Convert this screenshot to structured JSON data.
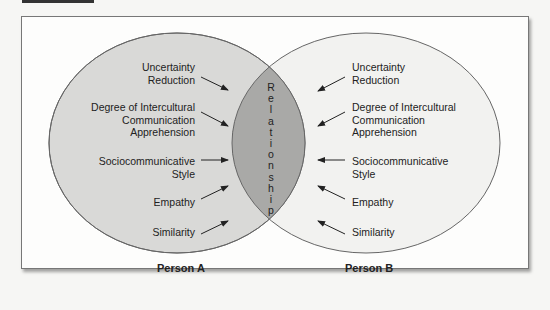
{
  "diagram": {
    "type": "venn",
    "colors": {
      "left_circle": "#d9d9d7",
      "right_circle": "#f2f2f0",
      "intersection": "#a9a9a7",
      "stroke": "#666666"
    },
    "person_a": {
      "label": "Person A",
      "factors": [
        {
          "line1": "Uncertainty",
          "line2": "Reduction",
          "line3": ""
        },
        {
          "line1": "Degree of Intercultural",
          "line2": "Communication",
          "line3": "Apprehension"
        },
        {
          "line1": "Sociocommunicative",
          "line2": "Style",
          "line3": ""
        },
        {
          "line1": "Empathy",
          "line2": "",
          "line3": ""
        },
        {
          "line1": "Similarity",
          "line2": "",
          "line3": ""
        }
      ]
    },
    "person_b": {
      "label": "Person B",
      "factors": [
        {
          "line1": "Uncertainty",
          "line2": "Reduction",
          "line3": ""
        },
        {
          "line1": "Degree of Intercultural",
          "line2": "Communication",
          "line3": "Apprehension"
        },
        {
          "line1": "Sociocommunicative",
          "line2": "Style",
          "line3": ""
        },
        {
          "line1": "Empathy",
          "line2": "",
          "line3": ""
        },
        {
          "line1": "Similarity",
          "line2": "",
          "line3": ""
        }
      ]
    },
    "intersection": {
      "label": "Relationship",
      "letters": [
        "R",
        "e",
        "l",
        "a",
        "t",
        "i",
        "o",
        "n",
        "s",
        "h",
        "i",
        "p"
      ]
    }
  }
}
